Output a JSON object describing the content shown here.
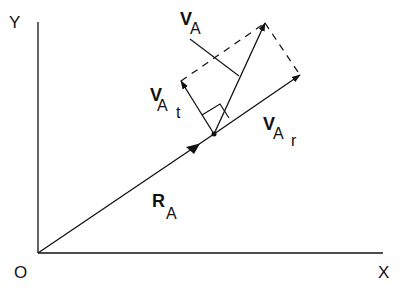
{
  "diagram": {
    "axes": {
      "y_label": "Y",
      "x_label": "X",
      "origin_label": "O"
    },
    "vectors": {
      "position": {
        "main": "R",
        "sub": "A"
      },
      "velocity": {
        "main": "V",
        "sub": "A"
      },
      "tangential": {
        "main": "V",
        "sub": "A",
        "subsub": "t"
      },
      "radial": {
        "main": "V",
        "sub": "A",
        "subsub": "r"
      }
    },
    "colors": {
      "line": "#111111",
      "background": "#ffffff"
    }
  }
}
